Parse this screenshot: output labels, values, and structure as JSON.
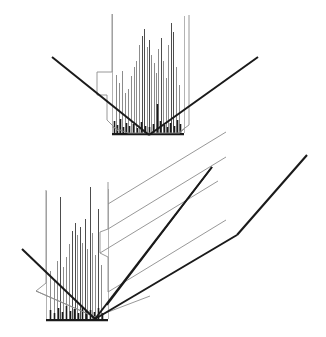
{
  "figure": {
    "title": "",
    "background_color": "#ffffff",
    "width": 326,
    "height": 337,
    "line_color_dark": "#1a1a1a",
    "line_color_mid": "#4d4d4d",
    "line_color_light": "#8c8c8c",
    "line_color_faint": "#b3b3b3"
  },
  "chart_data": {
    "type": "line",
    "title": "",
    "subtitle": "",
    "xlabel": "",
    "ylabel": "",
    "grid": false,
    "legend": null,
    "panels": [
      {
        "name": "front-view",
        "projection": "orthographic",
        "origin": {
          "x": 150,
          "y": 133
        },
        "spike_baseline_y": 133,
        "spike_x_start": 112,
        "spike_x_end": 184,
        "trough_left_tip": {
          "x": 52,
          "y": 57
        },
        "trough_right_tip": {
          "x": 258,
          "y": 57
        },
        "trough_bottom_left": {
          "x": 128,
          "y": 133
        },
        "trough_bottom_right": {
          "x": 180,
          "y": 133
        },
        "step_profile_points": [
          {
            "x": 112,
            "y": 14
          },
          {
            "x": 112,
            "y": 72
          },
          {
            "x": 97,
            "y": 72
          },
          {
            "x": 97,
            "y": 95
          },
          {
            "x": 107,
            "y": 95
          },
          {
            "x": 107,
            "y": 120
          },
          {
            "x": 118,
            "y": 131
          }
        ],
        "right_profile_points": [
          {
            "x": 189,
            "y": 15
          },
          {
            "x": 189,
            "y": 125
          },
          {
            "x": 178,
            "y": 133
          }
        ],
        "spikes": [
          {
            "x": 112,
            "h": 119,
            "w": 1.0,
            "tone": "faint"
          },
          {
            "x": 116,
            "h": 58,
            "w": 1.0,
            "tone": "light"
          },
          {
            "x": 119,
            "h": 50,
            "w": 1.0,
            "tone": "light"
          },
          {
            "x": 122,
            "h": 62,
            "w": 1.0,
            "tone": "light"
          },
          {
            "x": 125,
            "h": 40,
            "w": 1.0,
            "tone": "light"
          },
          {
            "x": 128,
            "h": 44,
            "w": 1.0,
            "tone": "light"
          },
          {
            "x": 131,
            "h": 57,
            "w": 1.0,
            "tone": "light"
          },
          {
            "x": 134,
            "h": 66,
            "w": 1.0,
            "tone": "light"
          },
          {
            "x": 136,
            "h": 72,
            "w": 1.0,
            "tone": "light"
          },
          {
            "x": 139,
            "h": 88,
            "w": 1.0,
            "tone": "light"
          },
          {
            "x": 142,
            "h": 97,
            "w": 1.0,
            "tone": "mid"
          },
          {
            "x": 144,
            "h": 104,
            "w": 1.0,
            "tone": "mid"
          },
          {
            "x": 147,
            "h": 86,
            "w": 1.0,
            "tone": "light"
          },
          {
            "x": 149,
            "h": 93,
            "w": 1.0,
            "tone": "mid"
          },
          {
            "x": 151,
            "h": 78,
            "w": 1.0,
            "tone": "light"
          },
          {
            "x": 154,
            "h": 70,
            "w": 1.0,
            "tone": "light"
          },
          {
            "x": 156,
            "h": 60,
            "w": 1.0,
            "tone": "light"
          },
          {
            "x": 158,
            "h": 84,
            "w": 1.0,
            "tone": "light"
          },
          {
            "x": 161,
            "h": 95,
            "w": 1.0,
            "tone": "mid"
          },
          {
            "x": 163,
            "h": 72,
            "w": 1.0,
            "tone": "light"
          },
          {
            "x": 166,
            "h": 55,
            "w": 1.0,
            "tone": "light"
          },
          {
            "x": 168,
            "h": 88,
            "w": 1.0,
            "tone": "light"
          },
          {
            "x": 171,
            "h": 110,
            "w": 1.0,
            "tone": "mid"
          },
          {
            "x": 173,
            "h": 101,
            "w": 1.0,
            "tone": "mid"
          },
          {
            "x": 176,
            "h": 66,
            "w": 1.0,
            "tone": "light"
          },
          {
            "x": 179,
            "h": 48,
            "w": 1.0,
            "tone": "light"
          },
          {
            "x": 184,
            "h": 117,
            "w": 1.0,
            "tone": "faint"
          }
        ],
        "dark_base_spikes": [
          {
            "x": 114,
            "h": 12
          },
          {
            "x": 117,
            "h": 8
          },
          {
            "x": 120,
            "h": 14
          },
          {
            "x": 123,
            "h": 6
          },
          {
            "x": 126,
            "h": 10
          },
          {
            "x": 129,
            "h": 7
          },
          {
            "x": 133,
            "h": 9
          },
          {
            "x": 137,
            "h": 5
          },
          {
            "x": 141,
            "h": 11
          },
          {
            "x": 145,
            "h": 7
          },
          {
            "x": 149,
            "h": 6
          },
          {
            "x": 153,
            "h": 9
          },
          {
            "x": 157,
            "h": 29
          },
          {
            "x": 160,
            "h": 12
          },
          {
            "x": 164,
            "h": 8
          },
          {
            "x": 167,
            "h": 6
          },
          {
            "x": 170,
            "h": 10
          },
          {
            "x": 174,
            "h": 7
          },
          {
            "x": 177,
            "h": 13
          },
          {
            "x": 180,
            "h": 9
          }
        ]
      },
      {
        "name": "perspective-view",
        "projection": "oblique-3d",
        "origin": {
          "x": 95,
          "y": 319
        },
        "spike_baseline_y": 319,
        "spike_x_start": 46,
        "spike_x_end": 108,
        "front_left_tip": {
          "x": 22,
          "y": 249
        },
        "front_bottom_vertex": {
          "x": 95,
          "y": 319
        },
        "front_right_ridge_top": {
          "x": 212,
          "y": 167
        },
        "back_right_ridge_top": {
          "x": 307,
          "y": 155
        },
        "back_bend_point": {
          "x": 237,
          "y": 235
        },
        "depth_offset": {
          "dx": 118,
          "dy": -72
        },
        "step_profile_points": [
          {
            "x": 46,
            "y": 190
          },
          {
            "x": 46,
            "y": 283
          },
          {
            "x": 36,
            "y": 291
          },
          {
            "x": 95,
            "y": 317
          }
        ],
        "right_wall_profile_points": [
          {
            "x": 108,
            "y": 182
          },
          {
            "x": 108,
            "y": 229
          },
          {
            "x": 100,
            "y": 232
          },
          {
            "x": 100,
            "y": 253
          },
          {
            "x": 108,
            "y": 257
          },
          {
            "x": 108,
            "y": 292
          }
        ],
        "spikes": [
          {
            "x": 46,
            "h": 128,
            "w": 1.0,
            "tone": "faint"
          },
          {
            "x": 50,
            "h": 48,
            "w": 1.0,
            "tone": "light"
          },
          {
            "x": 54,
            "h": 40,
            "w": 1.0,
            "tone": "light"
          },
          {
            "x": 57,
            "h": 58,
            "w": 1.0,
            "tone": "light"
          },
          {
            "x": 60,
            "h": 122,
            "w": 1.0,
            "tone": "mid"
          },
          {
            "x": 63,
            "h": 52,
            "w": 1.0,
            "tone": "light"
          },
          {
            "x": 66,
            "h": 62,
            "w": 1.0,
            "tone": "light"
          },
          {
            "x": 69,
            "h": 75,
            "w": 1.0,
            "tone": "light"
          },
          {
            "x": 72,
            "h": 88,
            "w": 1.0,
            "tone": "mid"
          },
          {
            "x": 75,
            "h": 96,
            "w": 1.0,
            "tone": "mid"
          },
          {
            "x": 77,
            "h": 84,
            "w": 1.0,
            "tone": "light"
          },
          {
            "x": 80,
            "h": 92,
            "w": 1.0,
            "tone": "mid"
          },
          {
            "x": 82,
            "h": 76,
            "w": 1.0,
            "tone": "light"
          },
          {
            "x": 85,
            "h": 100,
            "w": 1.0,
            "tone": "mid"
          },
          {
            "x": 87,
            "h": 70,
            "w": 1.0,
            "tone": "light"
          },
          {
            "x": 90,
            "h": 132,
            "w": 1.0,
            "tone": "mid"
          },
          {
            "x": 92,
            "h": 86,
            "w": 1.0,
            "tone": "light"
          },
          {
            "x": 95,
            "h": 64,
            "w": 1.0,
            "tone": "light"
          },
          {
            "x": 98,
            "h": 110,
            "w": 1.0,
            "tone": "mid"
          },
          {
            "x": 101,
            "h": 54,
            "w": 1.0,
            "tone": "light"
          },
          {
            "x": 108,
            "h": 130,
            "w": 1.0,
            "tone": "faint"
          }
        ],
        "dark_base_spikes": [
          {
            "x": 50,
            "h": 9
          },
          {
            "x": 54,
            "h": 6
          },
          {
            "x": 58,
            "h": 11
          },
          {
            "x": 62,
            "h": 7
          },
          {
            "x": 66,
            "h": 13
          },
          {
            "x": 70,
            "h": 8
          },
          {
            "x": 74,
            "h": 10
          },
          {
            "x": 78,
            "h": 6
          },
          {
            "x": 82,
            "h": 12
          },
          {
            "x": 86,
            "h": 8
          },
          {
            "x": 90,
            "h": 9
          },
          {
            "x": 94,
            "h": 7
          },
          {
            "x": 98,
            "h": 11
          },
          {
            "x": 102,
            "h": 6
          }
        ]
      }
    ]
  }
}
